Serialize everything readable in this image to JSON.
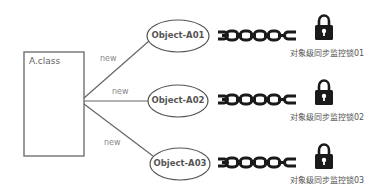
{
  "diagram": {
    "class_box": {
      "label": "A.class"
    },
    "edges": [
      {
        "label": "new",
        "target": "Object-A01"
      },
      {
        "label": "new",
        "target": "Object-A02"
      },
      {
        "label": "new",
        "target": "Object-A03"
      }
    ],
    "objects": [
      {
        "label": "Object-A01",
        "lock_caption": "对象级同步监控锁01"
      },
      {
        "label": "Object-A02",
        "lock_caption": "对象级同步监控锁02"
      },
      {
        "label": "Object-A03",
        "lock_caption": "对象级同步监控锁03"
      }
    ],
    "icons": {
      "chain": "chain-icon",
      "lock": "lock-icon"
    },
    "colors": {
      "stroke": "#666666",
      "icon": "#1a1a1a",
      "text": "#555555"
    }
  }
}
